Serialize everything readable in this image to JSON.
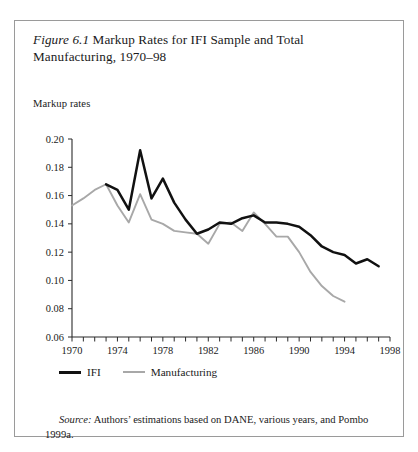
{
  "caption": {
    "figure_number": "Figure 6.1",
    "text": " Markup Rates for IFI Sample and Total Manufacturing, 1970–98"
  },
  "axis_title": "Markup rates",
  "legend": {
    "items": [
      {
        "label": "IFI",
        "color": "#111111"
      },
      {
        "label": "Manufacturing",
        "color": "#a8a8a8"
      }
    ]
  },
  "source": {
    "word": "Source:",
    "text": " Authors’ estimations based on DANE, various years, and Pombo 1999a."
  },
  "chart_data": {
    "type": "line",
    "title": "Markup Rates for IFI Sample and Total Manufacturing, 1970–98",
    "xlabel": "",
    "ylabel": "Markup rates",
    "xlim": [
      1970,
      1998
    ],
    "ylim": [
      0.06,
      0.2
    ],
    "yticks": [
      0.06,
      0.08,
      0.1,
      0.12,
      0.14,
      0.16,
      0.18,
      0.2
    ],
    "ytick_labels": [
      "0.06",
      "0.08",
      "0.10",
      "0.12",
      "0.14",
      "0.16",
      "0.18",
      "0.20"
    ],
    "xticks": [
      1970,
      1971,
      1972,
      1973,
      1974,
      1975,
      1976,
      1977,
      1978,
      1979,
      1980,
      1981,
      1982,
      1983,
      1984,
      1985,
      1986,
      1987,
      1988,
      1989,
      1990,
      1991,
      1992,
      1993,
      1994,
      1995,
      1996,
      1997,
      1998
    ],
    "xtick_labels_shown": [
      "1970",
      "1974",
      "1978",
      "1982",
      "1986",
      "1990",
      "1994",
      "1998"
    ],
    "grid": false,
    "legend_position": "below-axes-left",
    "series": [
      {
        "name": "IFI",
        "color": "#111111",
        "x": [
          1973,
          1974,
          1975,
          1976,
          1977,
          1978,
          1979,
          1980,
          1981,
          1982,
          1983,
          1984,
          1985,
          1986,
          1987,
          1988,
          1989,
          1990,
          1991,
          1992,
          1993,
          1994,
          1995,
          1996,
          1997
        ],
        "values": [
          0.168,
          0.164,
          0.15,
          0.192,
          0.158,
          0.172,
          0.155,
          0.143,
          0.133,
          0.136,
          0.141,
          0.14,
          0.144,
          0.146,
          0.141,
          0.141,
          0.14,
          0.138,
          0.132,
          0.124,
          0.12,
          0.118,
          0.112,
          0.115,
          0.11
        ]
      },
      {
        "name": "Manufacturing",
        "color": "#a8a8a8",
        "x": [
          1970,
          1971,
          1972,
          1973,
          1974,
          1975,
          1976,
          1977,
          1978,
          1979,
          1980,
          1981,
          1982,
          1983,
          1984,
          1985,
          1986,
          1987,
          1988,
          1989,
          1990,
          1991,
          1992,
          1993,
          1994
        ],
        "values": [
          0.153,
          0.158,
          0.164,
          0.168,
          0.153,
          0.141,
          0.161,
          0.143,
          0.14,
          0.135,
          0.134,
          0.133,
          0.126,
          0.14,
          0.141,
          0.135,
          0.148,
          0.14,
          0.131,
          0.131,
          0.12,
          0.106,
          0.096,
          0.089,
          0.085
        ]
      }
    ]
  }
}
